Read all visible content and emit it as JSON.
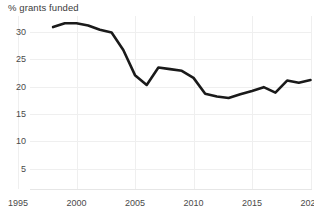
{
  "chart_data": {
    "type": "line",
    "title": "% grants funded",
    "xlabel": "",
    "ylabel": "",
    "grid": true,
    "legend": "none",
    "xlim": [
      1995,
      2021
    ],
    "ylim": [
      0,
      32
    ],
    "xticks": [
      1995,
      2000,
      2005,
      2010,
      2015,
      2020
    ],
    "yticks": [
      5,
      10,
      15,
      20,
      25,
      30
    ],
    "x": [
      1998,
      1999,
      2000,
      2001,
      2002,
      2003,
      2004,
      2005,
      2006,
      2007,
      2008,
      2009,
      2010,
      2011,
      2012,
      2013,
      2014,
      2015,
      2016,
      2017,
      2018,
      2019,
      2020
    ],
    "values": [
      30.9,
      31.6,
      31.6,
      31.2,
      30.4,
      29.9,
      26.7,
      22.1,
      20.3,
      23.5,
      23.2,
      22.9,
      21.6,
      18.7,
      18.2,
      17.9,
      18.6,
      19.2,
      19.9,
      18.9,
      21.1,
      20.7,
      21.2
    ],
    "series": [
      {
        "name": "% grants funded",
        "color": "#1a1a1a",
        "values": [
          30.9,
          31.6,
          31.6,
          31.2,
          30.4,
          29.9,
          26.7,
          22.1,
          20.3,
          23.5,
          23.2,
          22.9,
          21.6,
          18.7,
          18.2,
          17.9,
          18.6,
          19.2,
          19.9,
          18.9,
          21.1,
          20.7,
          21.2
        ]
      }
    ]
  },
  "axis": {
    "y_labels": [
      "30",
      "25",
      "20",
      "15",
      "10",
      "5"
    ],
    "x_labels": [
      "1995",
      "2000",
      "2005",
      "2010",
      "2015",
      "2020"
    ]
  },
  "colors": {
    "line": "#1a1a1a",
    "grid": "#efefef",
    "text": "#4a4a4a",
    "background": "#ffffff"
  }
}
